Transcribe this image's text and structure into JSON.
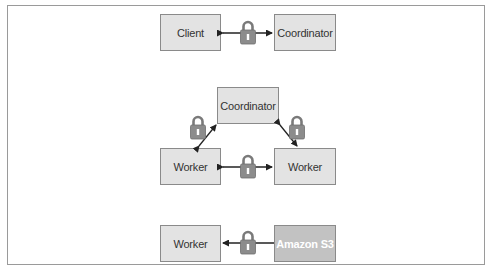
{
  "diagram": {
    "colors": {
      "node_fill": "#e3e3e3",
      "node_border": "#8a8a8a",
      "storage_fill": "#c2c2c2",
      "lock_fill": "#8c8c8c",
      "arrow": "#222222",
      "frame": "#9a9a9a"
    },
    "rows": [
      {
        "name": "client-coordinator",
        "left": {
          "label": "Client"
        },
        "right": {
          "label": "Coordinator"
        },
        "connection": {
          "type": "bidirectional",
          "icon": "lock-icon"
        }
      },
      {
        "name": "coordinator-workers",
        "top": {
          "label": "Coordinator"
        },
        "left": {
          "label": "Worker"
        },
        "right": {
          "label": "Worker"
        },
        "connections": [
          {
            "from": "Coordinator",
            "to": "Worker (left)",
            "type": "bidirectional",
            "icon": "lock-icon"
          },
          {
            "from": "Coordinator",
            "to": "Worker (right)",
            "type": "bidirectional",
            "icon": "lock-icon"
          },
          {
            "from": "Worker (left)",
            "to": "Worker (right)",
            "type": "bidirectional",
            "icon": "lock-icon"
          }
        ]
      },
      {
        "name": "s3-worker",
        "left": {
          "label": "Worker"
        },
        "right": {
          "label": "Amazon S3"
        },
        "connection": {
          "type": "unidirectional",
          "direction": "right-to-left",
          "icon": "lock-icon"
        }
      }
    ]
  }
}
